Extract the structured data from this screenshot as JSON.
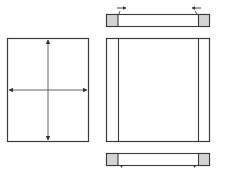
{
  "diagram": {
    "colors": {
      "stroke": "#3a3a3a",
      "arrow": "#333333",
      "shaded_cap": "#d4d4d4",
      "background": "#ffffff"
    },
    "left_panel": {
      "label": "",
      "arrows": [
        "vertical-bidirectional",
        "horizontal-bidirectional"
      ]
    },
    "right_panel": {
      "top_bar": {
        "caps": [
          "left-cap",
          "right-cap"
        ],
        "arrows": [
          "inward-right",
          "inward-left"
        ]
      },
      "frame": {
        "side_strips": [
          "left-strip",
          "right-strip"
        ]
      },
      "bottom_bar": {
        "caps": [
          "left-cap",
          "right-cap"
        ],
        "ticks": [
          "left-tick",
          "right-tick"
        ]
      }
    }
  }
}
